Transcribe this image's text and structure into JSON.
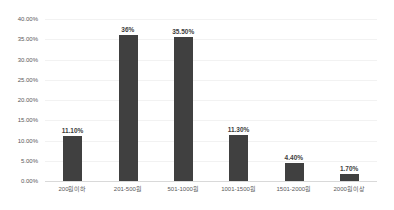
{
  "chart_data": {
    "type": "bar",
    "title": "",
    "xlabel": "",
    "ylabel": "",
    "categories": [
      "200원이하",
      "201-500원",
      "501-1000원",
      "1001-1500원",
      "1501-2000원",
      "2000원이상"
    ],
    "values": [
      11.1,
      36,
      35.5,
      11.3,
      4.4,
      1.7
    ],
    "data_labels": [
      "11.10%",
      "36%",
      "35.50%",
      "11.30%",
      "4.40%",
      "1.70%"
    ],
    "ylim": [
      0,
      40
    ],
    "ytick_step": 5,
    "ytick_labels": [
      "0.00%",
      "5.00%",
      "10.00%",
      "15.00%",
      "20.00%",
      "25.00%",
      "30.00%",
      "35.00%",
      "40.00%"
    ],
    "grid": true,
    "legend": "none",
    "colors": {
      "bar": "#404040",
      "gridline": "#f2f2f2",
      "axis_line": "#d9d9d9",
      "tick_text": "#595959",
      "data_label_text": "#404040",
      "background": "#ffffff"
    }
  }
}
